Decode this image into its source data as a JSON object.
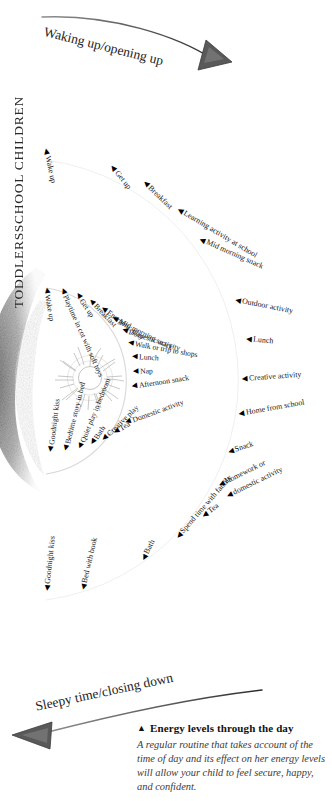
{
  "figure": {
    "caption_title": "Energy levels through the day",
    "caption_title_marker": "▲",
    "caption_body": "A regular routine that takes account of the time of day and its effect on her energy levels will allow your child to feel secure, happy, and confident.",
    "phase_top": "Waking up/opening up",
    "phase_bottom": "Sleepy time/closing down",
    "arrow_top_icon": "curved-arrow-right-icon",
    "arrow_bottom_icon": "curved-arrow-left-icon",
    "center_icon": "sun-sketch-icon",
    "shadow_icon": "crescent-shadow-icon",
    "tick_marker": "◀",
    "ink_color": "#1a1a1a",
    "background_color": "#ffffff"
  },
  "categories": [
    {
      "key": "school",
      "label": "SCHOOL CHILDREN"
    },
    {
      "key": "toddlers",
      "label": "TODDLERS"
    }
  ],
  "chart_data": {
    "type": "radial-timeline",
    "title": "Energy levels through the day",
    "center": {
      "x": 36,
      "y": 380
    },
    "series": [
      {
        "name": "TODDLERS",
        "radius": 92,
        "points": [
          {
            "label": "Wake up",
            "angle": -92,
            "x": 46,
            "y": 284,
            "rot": 80
          },
          {
            "label": "Playtime in cot with soft toys",
            "angle": -84,
            "x": 62,
            "y": 285,
            "rot": 66
          },
          {
            "label": "Get up",
            "angle": -74,
            "x": 77,
            "y": 290,
            "rot": 56
          },
          {
            "label": "Breakfast",
            "angle": -65,
            "x": 90,
            "y": 296,
            "rot": 46
          },
          {
            "label": "Energetic play",
            "angle": -55,
            "x": 102,
            "y": 304,
            "rot": 36
          },
          {
            "label": "Mid morning snack",
            "angle": -45,
            "x": 113,
            "y": 314,
            "rot": 27
          },
          {
            "label": "Domestic activity",
            "angle": -35,
            "x": 122,
            "y": 326,
            "rot": 18
          },
          {
            "label": "Walk or trip to shops",
            "angle": -24,
            "x": 128,
            "y": 339,
            "rot": 10
          },
          {
            "label": "Lunch",
            "angle": -13,
            "x": 132,
            "y": 353,
            "rot": 3
          },
          {
            "label": "Nap",
            "angle": -2,
            "x": 133,
            "y": 368,
            "rot": -2
          },
          {
            "label": "Afternoon snack",
            "angle": 9,
            "x": 132,
            "y": 383,
            "rot": -9
          },
          {
            "label": "Domestic activity",
            "angle": 22,
            "x": 126,
            "y": 419,
            "rot": -20
          },
          {
            "label": "Tea",
            "angle": 32,
            "x": 114,
            "y": 429,
            "rot": -31
          },
          {
            "label": "Creative play",
            "angle": 43,
            "x": 103,
            "y": 436,
            "rot": -44
          },
          {
            "label": "Bath",
            "angle": 54,
            "x": 92,
            "y": 441,
            "rot": -57
          },
          {
            "label": "Quiet play in bedroom",
            "angle": 64,
            "x": 80,
            "y": 445,
            "rot": -68
          },
          {
            "label": "Bedtime story in bed",
            "angle": 75,
            "x": 66,
            "y": 447,
            "rot": -76
          },
          {
            "label": "Goodnight kiss",
            "angle": 86,
            "x": 51,
            "y": 448,
            "rot": -83
          }
        ]
      },
      {
        "name": "SCHOOL CHILDREN",
        "radius": 205,
        "points": [
          {
            "label": "Wake up",
            "angle": -92,
            "x": 46,
            "y": 145,
            "rot": 78
          },
          {
            "label": "Get up",
            "angle": -74,
            "x": 112,
            "y": 162,
            "rot": 52
          },
          {
            "label": "Breakfast",
            "angle": -62,
            "x": 144,
            "y": 178,
            "rot": 44
          },
          {
            "label": "Learning activity at school",
            "angle": -48,
            "x": 178,
            "y": 205,
            "rot": 31
          },
          {
            "label": "Mid morning snack",
            "angle": -36,
            "x": 200,
            "y": 235,
            "rot": 24
          },
          {
            "label": "Outdoor activity",
            "angle": -20,
            "x": 235,
            "y": 296,
            "rot": 11
          },
          {
            "label": "Lunch",
            "angle": -9,
            "x": 246,
            "y": 335,
            "rot": 5
          },
          {
            "label": "Creative activity",
            "angle": 3,
            "x": 242,
            "y": 375,
            "rot": -4
          },
          {
            "label": "Home from school",
            "angle": 14,
            "x": 239,
            "y": 410,
            "rot": -10
          },
          {
            "label": "Snack",
            "angle": 24,
            "x": 228,
            "y": 448,
            "rot": -18
          },
          {
            "label": "Homework or",
            "angle": 34,
            "x": 219,
            "y": 481,
            "rot": -26
          },
          {
            "label": "domestic activity",
            "angle": 34,
            "x": 227,
            "y": 492,
            "rot": -26
          },
          {
            "label": "Tea",
            "angle": 44,
            "x": 203,
            "y": 512,
            "rot": -36
          },
          {
            "label": "Spend time with family",
            "angle": 55,
            "x": 177,
            "y": 534,
            "rot": -49
          },
          {
            "label": "Bath",
            "angle": 67,
            "x": 143,
            "y": 556,
            "rot": -63
          },
          {
            "label": "Bed with book",
            "angle": 80,
            "x": 83,
            "y": 586,
            "rot": -77
          },
          {
            "label": "Goodnight kiss",
            "angle": 90,
            "x": 47,
            "y": 587,
            "rot": -84
          }
        ]
      }
    ]
  }
}
